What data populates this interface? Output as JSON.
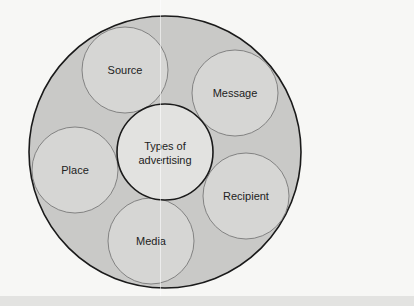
{
  "diagram": {
    "title": "Types of advertising",
    "center": {
      "label_line1": "Types of",
      "label_line2": "advertising",
      "cx": 165,
      "cy": 152,
      "r": 48
    },
    "outer": {
      "cx": 165,
      "cy": 152,
      "r": 136
    },
    "nodes": [
      {
        "label": "Source",
        "cx": 125,
        "cy": 70,
        "r": 43
      },
      {
        "label": "Message",
        "cx": 235,
        "cy": 93,
        "r": 43
      },
      {
        "label": "Place",
        "cx": 75,
        "cy": 170,
        "r": 43
      },
      {
        "label": "Recipient",
        "cx": 246,
        "cy": 196,
        "r": 43
      },
      {
        "label": "Media",
        "cx": 151,
        "cy": 241,
        "r": 43
      }
    ],
    "colors": {
      "outer_fill": "#c9c9c7",
      "node_fill": "#d6d6d4",
      "center_fill": "#e2e2e0",
      "stroke": "#1a1a1a",
      "thin_stroke": "#6e6e6e"
    }
  }
}
